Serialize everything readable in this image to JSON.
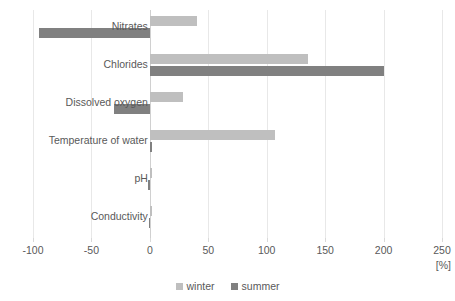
{
  "chart_data": {
    "type": "bar",
    "orientation": "horizontal",
    "title": "",
    "xlabel": "[%]",
    "ylabel": "",
    "xlim": [
      -100,
      250
    ],
    "xticks": [
      -100,
      -50,
      0,
      50,
      100,
      150,
      200,
      250
    ],
    "xtick_labels": [
      "-100",
      "-50",
      "0",
      "50",
      "100",
      "150",
      "200",
      "250"
    ],
    "grid": true,
    "legend_position": "bottom",
    "categories": [
      "Nitrates",
      "Chlorides",
      "Dissolved oxygen",
      "Temperature of water",
      "pH",
      "Conductivity"
    ],
    "series": [
      {
        "name": "winter",
        "color": "#bfbfbf",
        "values": [
          40,
          135,
          28,
          107,
          2,
          2
        ]
      },
      {
        "name": "summer",
        "color": "#808080",
        "values": [
          -95,
          200,
          -31,
          2,
          -2,
          -1
        ]
      }
    ]
  },
  "axis": {
    "unit_label": "[%]"
  },
  "legend": {
    "items": [
      {
        "label": "winter",
        "color": "#bfbfbf"
      },
      {
        "label": "summer",
        "color": "#808080"
      }
    ]
  }
}
